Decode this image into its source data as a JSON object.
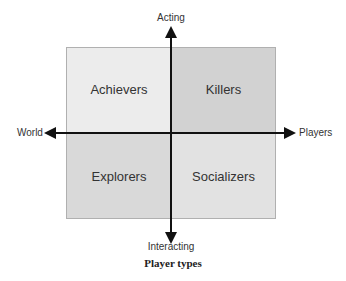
{
  "quadrants": {
    "top_left": {
      "label": "Achievers",
      "color": "#ececec"
    },
    "top_right": {
      "label": "Killers",
      "color": "#d2d2d2"
    },
    "bottom_left": {
      "label": "Explorers",
      "color": "#d9d9d9"
    },
    "bottom_right": {
      "label": "Socializers",
      "color": "#e2e2e2"
    }
  },
  "axes": {
    "top": "Acting",
    "bottom": "Interacting",
    "left": "World",
    "right": "Players"
  },
  "caption": "Player types"
}
